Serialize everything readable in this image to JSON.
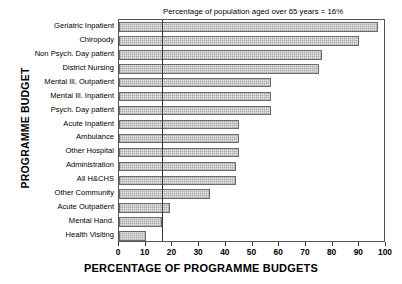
{
  "chart_data": {
    "type": "bar",
    "orientation": "horizontal",
    "title": "",
    "xlabel": "PERCENTAGE OF PROGRAMME BUDGETS",
    "ylabel": "PROGRAMME BUDGET",
    "xlim": [
      0,
      100
    ],
    "xticks": [
      0,
      10,
      20,
      30,
      40,
      50,
      60,
      70,
      80,
      90,
      100
    ],
    "grid": false,
    "legend": null,
    "categories": [
      "Geriatric Inpatient",
      "Chiropody",
      "Non Psych. Day patient",
      "District Nursing",
      "Mental Ill. Outpatient",
      "Mental Ill. Inpatient",
      "Psych. Day patient",
      "Acute Inpatient",
      "Ambulance",
      "Other Hospital",
      "Administration",
      "All H&CHS",
      "Other Community",
      "Acute Outpatient",
      "Mental Hand.",
      "Health Visiting"
    ],
    "values": [
      97,
      90,
      76,
      75,
      57,
      57,
      57,
      45,
      45,
      45,
      44,
      44,
      34,
      19,
      16,
      10
    ],
    "annotations": [
      {
        "text": "Percentage of population aged over 65 years = 16%",
        "reference_value": 16,
        "type": "vertical-reference-line"
      }
    ],
    "colors": {
      "bar_fill": "#e8e8e8",
      "bar_border": "#6b6b6b",
      "reference_line": "#333333",
      "frame": "#555555",
      "text": "#000000"
    }
  }
}
